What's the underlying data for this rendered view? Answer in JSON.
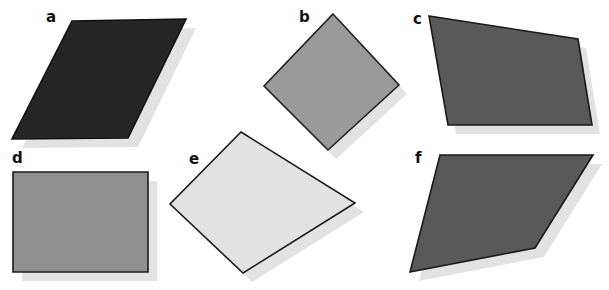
{
  "figure": {
    "background_color": "#ffffff",
    "width": 609,
    "height": 290,
    "shadow_color": "#e2e2e2",
    "outline_color": "#1a1a1a",
    "shapes": [
      {
        "id": "a",
        "label": "a",
        "kind": "parallelogram",
        "fill": "#262626",
        "stroke": "#111111",
        "points": "72,21 186,19 128,138 12,139",
        "shadow_points": "82,30 196,28 138,147 22,148",
        "label_x": 46,
        "label_y": 10
      },
      {
        "id": "b",
        "label": "b",
        "kind": "square-rotated",
        "fill": "#9a9a9a",
        "stroke": "#1f1f1f",
        "points": "333,14 399,85 328,150 264,86",
        "shadow_points": "341,23 407,94 336,159 272,95",
        "label_x": 299,
        "label_y": 10
      },
      {
        "id": "c",
        "label": "c",
        "kind": "quadrilateral",
        "fill": "#595959",
        "stroke": "#1a1a1a",
        "points": "429,16 578,39 592,125 448,125",
        "shadow_points": "437,25 586,48 600,134 456,134",
        "label_x": 413,
        "label_y": 12
      },
      {
        "id": "d",
        "label": "d",
        "kind": "rectangle",
        "fill": "#8f8f8f",
        "stroke": "#1a1a1a",
        "points": "13,172 148,172 148,272 13,272",
        "shadow_points": "22,181 157,181 157,281 22,281",
        "label_x": 12,
        "label_y": 151
      },
      {
        "id": "e",
        "label": "e",
        "kind": "quadrilateral",
        "fill": "#e2e2e2",
        "stroke": "#1a1a1a",
        "points": "241,132 355,203 243,273 170,204",
        "shadow_points": "250,141 364,212 252,282 179,213",
        "label_x": 189,
        "label_y": 152
      },
      {
        "id": "f",
        "label": "f",
        "kind": "pentagon",
        "fill": "#595959",
        "stroke": "#1a1a1a",
        "points": "440,155 593,155 535,248 410,272",
        "shadow_points": "449,164 602,164 544,257 419,281",
        "label_x": 415,
        "label_y": 151
      }
    ]
  }
}
